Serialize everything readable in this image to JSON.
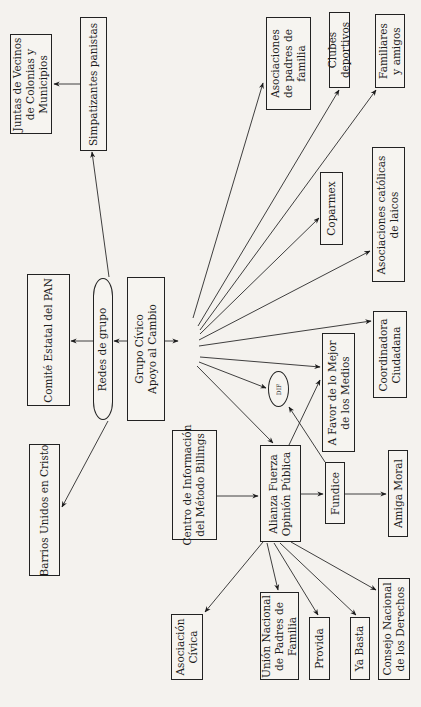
{
  "diagram": {
    "orientation": "rotated-90-ccw",
    "nodes": {
      "juntas": {
        "label": "Juntas de Vecinos\nde Colonias y\nMunicipios"
      },
      "simpatizantes": {
        "label": "Simpatizantes panistas"
      },
      "asoc_padres": {
        "label": "Asociaciones\nde padres de\nfamilia"
      },
      "clubes": {
        "label": "Clubes\ndeportivos"
      },
      "familiares": {
        "label": "Familiares\ny amigos"
      },
      "coparmex": {
        "label": "Coparmex"
      },
      "asoc_catolicas": {
        "label": "Asociaciones católicas\nde laicos"
      },
      "comite": {
        "label": "Comité Estatal del PAN"
      },
      "redes": {
        "label": "Redes de grupo"
      },
      "grupo_civico": {
        "label": "Grupo Cívico\nApoyo al Cambio"
      },
      "coordinadora": {
        "label": "Coordinadora\nCiudadana"
      },
      "a_favor": {
        "label": "A Favor de lo Mejor\nde los Medios"
      },
      "dif": {
        "label": "DIF"
      },
      "centro": {
        "label": "Centro de Información\ndel Método Billings"
      },
      "alianza": {
        "label": "Alianza Fuerza\nOpinión Pública"
      },
      "fundice": {
        "label": "Fundice"
      },
      "amiga_moral": {
        "label": "Amiga Moral"
      },
      "barrios": {
        "label": "Barrios Unidos en Cristo"
      },
      "asoc_civica": {
        "label": "Asociación\nCívica"
      },
      "union_nacional": {
        "label": "Unión Nacional\nde Padres de\nFamilia"
      },
      "provida": {
        "label": "Provida"
      },
      "ya_basta": {
        "label": "Ya Basta"
      },
      "consejo": {
        "label": "Consejo Nacional\nde los Derechos"
      }
    },
    "edges": [
      {
        "from": "redes",
        "to": "simpatizantes"
      },
      {
        "from": "simpatizantes",
        "to": "juntas"
      },
      {
        "from": "redes",
        "to": "comite"
      },
      {
        "from": "redes",
        "to": "barrios"
      },
      {
        "from": "grupo_civico",
        "to": "redes"
      },
      {
        "from": "grupo_civico",
        "to": "hub"
      },
      {
        "from": "hub",
        "to": "asoc_padres"
      },
      {
        "from": "hub",
        "to": "clubes"
      },
      {
        "from": "hub",
        "to": "familiares"
      },
      {
        "from": "hub",
        "to": "coparmex"
      },
      {
        "from": "hub",
        "to": "asoc_catolicas"
      },
      {
        "from": "hub",
        "to": "coordinadora"
      },
      {
        "from": "hub",
        "to": "a_favor"
      },
      {
        "from": "hub",
        "to": "dif"
      },
      {
        "from": "hub",
        "to": "alianza"
      },
      {
        "from": "centro",
        "to": "alianza"
      },
      {
        "from": "alianza",
        "to": "a_favor"
      },
      {
        "from": "alianza",
        "to": "fundice"
      },
      {
        "from": "fundice",
        "to": "dif"
      },
      {
        "from": "fundice",
        "to": "amiga_moral"
      },
      {
        "from": "alianza",
        "to": "asoc_civica"
      },
      {
        "from": "alianza",
        "to": "union_nacional"
      },
      {
        "from": "alianza",
        "to": "provida"
      },
      {
        "from": "alianza",
        "to": "ya_basta"
      },
      {
        "from": "alianza",
        "to": "consejo"
      }
    ]
  }
}
